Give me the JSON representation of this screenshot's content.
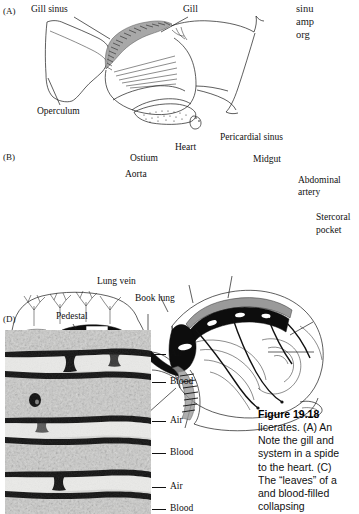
{
  "page": {
    "background": "#ffffff",
    "width": 359,
    "height": 514
  },
  "panels": {
    "a": {
      "letter": "(A)",
      "labels": {
        "gill_sinus": "Gill sinus",
        "gill": "Gill",
        "operculum": "Operculum"
      }
    },
    "b": {
      "letter": "(B)",
      "labels": {
        "ostium": "Ostium",
        "heart": "Heart",
        "pericardial_sinus": "Pericardial  sinus",
        "midgut": "Midgut",
        "aorta": "Aorta",
        "abdominal_artery_line1": "Abdominal",
        "abdominal_artery_line2": "artery",
        "stercoral_line1": "Stercoral",
        "stercoral_line2": "pocket",
        "lung_vein": "Lung  vein",
        "book_lung": "Book lung"
      }
    },
    "d": {
      "letter": "(D)",
      "labels": {
        "pedestal": "Pedestal",
        "series": [
          "Air",
          "Blood",
          "Air",
          "Blood",
          "Air",
          "Blood"
        ]
      }
    }
  },
  "body_column": {
    "lines": [
      "sinu",
      "amp",
      "org"
    ]
  },
  "caption": {
    "title": "Figure 19.18",
    "lines": [
      "licerates. (A) An",
      "Note the gill and",
      "system in a spide",
      "to the heart. (C)",
      "The “leaves” of a",
      "and blood-filled",
      "collapsing"
    ]
  },
  "colors": {
    "ink": "#1a1a1a",
    "vessel_fill": "#0d0d0d",
    "tissue_gray": "#9a9a9a",
    "micrograph_base": "#cfcfcf"
  }
}
